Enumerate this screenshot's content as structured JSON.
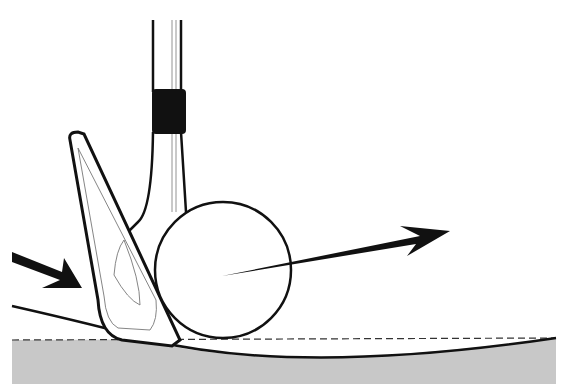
{
  "illustration": {
    "subject": "golf wedge striking ball from tight lie",
    "elements": [
      "club-shaft",
      "ferrule",
      "wedge-head",
      "golf-ball",
      "ball-direction-arrow",
      "club-approach-arrow",
      "turf-line",
      "ground-level-dashed-line",
      "ground"
    ],
    "colors": {
      "ink": "#111111",
      "ground": "#c8c8c8",
      "background": "#ffffff"
    }
  }
}
